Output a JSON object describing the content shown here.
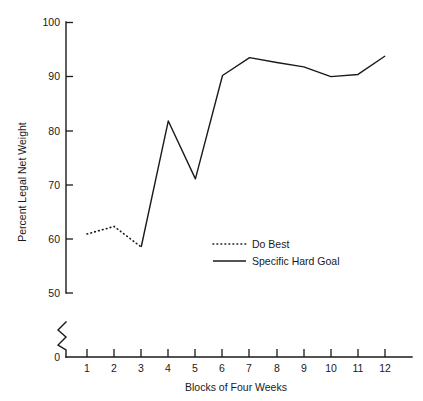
{
  "chart_data": {
    "type": "line",
    "title": "",
    "xlabel": "Blocks of Four Weeks",
    "ylabel": "Percent Legal Net Weight",
    "x": [
      1,
      2,
      3,
      4,
      5,
      6,
      7,
      8,
      9,
      10,
      11,
      12
    ],
    "xticklabels": [
      "1",
      "2",
      "3",
      "4",
      "5",
      "6",
      "7",
      "8",
      "9",
      "10",
      "11",
      "12"
    ],
    "yticklabels": [
      "0",
      "50",
      "60",
      "70",
      "80",
      "90",
      "100"
    ],
    "yticks": [
      0,
      50,
      60,
      70,
      80,
      90,
      100
    ],
    "ylim": [
      50,
      100
    ],
    "y_axis_break": true,
    "grid": false,
    "legend_position": "center",
    "series": [
      {
        "name": "Do Best",
        "style": "dotted",
        "x": [
          1,
          2,
          3
        ],
        "values": [
          60.9,
          62.3,
          58.5
        ]
      },
      {
        "name": "Specific Hard Goal",
        "style": "solid",
        "x": [
          3,
          4,
          5,
          6,
          7,
          8,
          9,
          10,
          11,
          12
        ],
        "values": [
          58.5,
          81.8,
          71.1,
          90.2,
          93.5,
          92.6,
          91.8,
          90.0,
          90.4,
          93.8
        ]
      }
    ],
    "legend": [
      {
        "label": "Do Best",
        "style": "dotted"
      },
      {
        "label": "Specific Hard Goal",
        "style": "solid"
      }
    ]
  }
}
